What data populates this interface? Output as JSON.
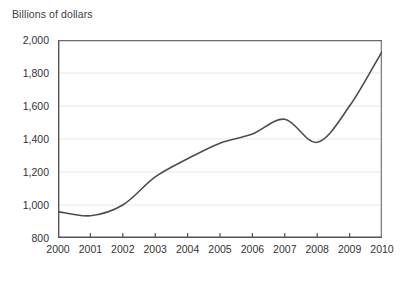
{
  "chart_data": {
    "type": "line",
    "title": "Billions of dollars",
    "subtitle": "",
    "xlabel": "",
    "ylabel": "",
    "x": [
      2000,
      2001,
      2002,
      2003,
      2004,
      2005,
      2006,
      2007,
      2008,
      2009,
      2010
    ],
    "categories": [
      "2000",
      "2001",
      "2002",
      "2003",
      "2004",
      "2005",
      "2006",
      "2007",
      "2008",
      "2009",
      "2010"
    ],
    "values": [
      960,
      935,
      1000,
      1170,
      1280,
      1375,
      1430,
      1520,
      1380,
      1600,
      1930
    ],
    "series": [
      {
        "name": "Billions of dollars",
        "values": [
          960,
          935,
          1000,
          1170,
          1280,
          1375,
          1430,
          1520,
          1380,
          1600,
          1930
        ]
      }
    ],
    "xlim": [
      2000,
      2010
    ],
    "ylim": [
      800,
      2000
    ],
    "y_ticks": [
      800,
      1000,
      1200,
      1400,
      1600,
      1800,
      2000
    ],
    "y_tick_labels": [
      "800",
      "1,000",
      "1,200",
      "1,400",
      "1,600",
      "1,800",
      "2,000"
    ],
    "x_ticks": [
      2000,
      2001,
      2002,
      2003,
      2004,
      2005,
      2006,
      2007,
      2008,
      2009,
      2010
    ],
    "x_tick_labels": [
      "2000",
      "2001",
      "2002",
      "2003",
      "2004",
      "2005",
      "2006",
      "2007",
      "2008",
      "2009",
      "2010"
    ],
    "grid": "horizontal",
    "legend": "none",
    "line_color": "#4d4d4d",
    "grid_color": "#e8e8e8",
    "axis_color": "#555555",
    "background_color": "#ffffff",
    "annotations": []
  }
}
